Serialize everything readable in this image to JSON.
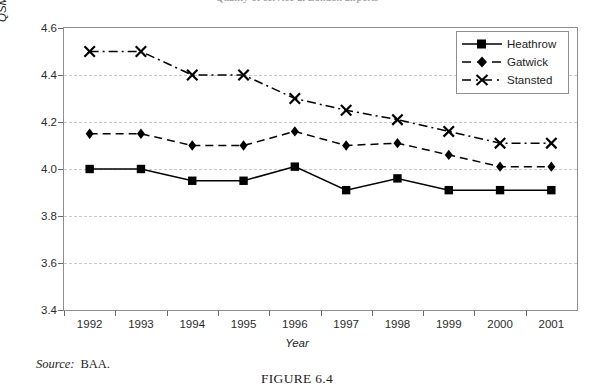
{
  "top_partial_text": "Quality of service at London airports",
  "chart_data": {
    "type": "line",
    "title": "",
    "xlabel": "Year",
    "ylabel": "QSM score (from 1=extremely poor to 5=excellent)",
    "categories": [
      "1992",
      "1993",
      "1994",
      "1995",
      "1996",
      "1997",
      "1998",
      "1999",
      "2000",
      "2001"
    ],
    "ylim": [
      3.4,
      4.6
    ],
    "yticks": [
      "3.4",
      "3.6",
      "3.8",
      "4.0",
      "4.2",
      "4.4",
      "4.6"
    ],
    "grid": true,
    "legend_position": "top-right",
    "series": [
      {
        "name": "Heathrow",
        "marker": "square",
        "line_style": "solid",
        "color": "#000000",
        "values": [
          4.0,
          4.0,
          3.95,
          3.95,
          4.01,
          3.91,
          3.96,
          3.91,
          3.91,
          3.91
        ]
      },
      {
        "name": "Gatwick",
        "marker": "diamond",
        "line_style": "dashed",
        "color": "#000000",
        "values": [
          4.15,
          4.15,
          4.1,
          4.1,
          4.16,
          4.1,
          4.11,
          4.06,
          4.01,
          4.01
        ]
      },
      {
        "name": "Stansted",
        "marker": "cross",
        "line_style": "dash-dot",
        "color": "#000000",
        "values": [
          4.5,
          4.5,
          4.4,
          4.4,
          4.3,
          4.25,
          4.21,
          4.16,
          4.11,
          4.11
        ]
      }
    ]
  },
  "footer": {
    "source_label": "Source:",
    "source_value": "BAA.",
    "figure_caption": "FIGURE 6.4"
  }
}
